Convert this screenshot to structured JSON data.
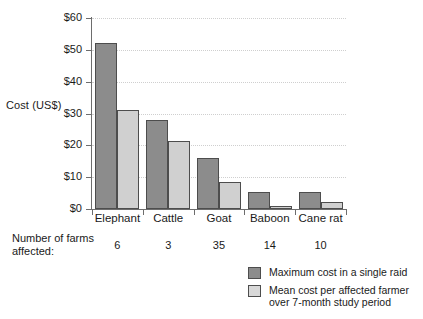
{
  "chart_data": {
    "type": "bar",
    "title": "",
    "subtitle": "",
    "xlabel": "",
    "ylabel": "Cost (US$)",
    "ylim": [
      0,
      60
    ],
    "yticks": [
      0,
      10,
      20,
      30,
      40,
      50,
      60
    ],
    "ytick_labels": [
      "$0",
      "$10",
      "$20",
      "$30",
      "$40",
      "$50",
      "$60"
    ],
    "grid": "horizontal-dotted",
    "legend_position": "bottom-right",
    "categories": [
      "Elephant",
      "Cattle",
      "Goat",
      "Baboon",
      "Cane rat"
    ],
    "series": [
      {
        "name": "Maximum cost in a single raid",
        "color": "#8c8c8c",
        "values": [
          52,
          28,
          16,
          5.5,
          5.3
        ]
      },
      {
        "name": "Mean cost per affected farmer\nover 7-month study period",
        "color": "#d0d0d0",
        "values": [
          31,
          21.5,
          8.5,
          1,
          2.3
        ]
      }
    ],
    "annotations": {
      "farms_caption": "Number of farms\naffected:",
      "farms_label_line1": "Number of farms",
      "farms_label_line2": "affected:",
      "farms_affected": [
        "6",
        "3",
        "35",
        "14",
        "10"
      ]
    }
  },
  "axis": {
    "ylabel": "Cost (US$)",
    "ytick_labels": [
      "$60",
      "$50",
      "$40",
      "$30",
      "$20",
      "$10",
      "$0"
    ],
    "category_labels": [
      "Elephant",
      "Cattle",
      "Goat",
      "Baboon",
      "Cane rat"
    ]
  },
  "farms": {
    "caption_line1": "Number of farms",
    "caption_line2": "affected:",
    "values": [
      "6",
      "3",
      "35",
      "14",
      "10"
    ]
  },
  "legend": {
    "items": [
      {
        "label": "Maximum cost in a single raid",
        "color": "#8c8c8c"
      },
      {
        "label": "Mean cost per affected farmer\nover 7-month study period",
        "color": "#d8d8d8"
      }
    ]
  },
  "colors": {
    "series_dark": "#8c8c8c",
    "series_light": "#d0d0d0",
    "bar_border": "#4d4d4d",
    "axis": "#6d6d6d",
    "grid": "#cfcfcf",
    "background": "#ffffff",
    "text": "#1a1a1a"
  }
}
